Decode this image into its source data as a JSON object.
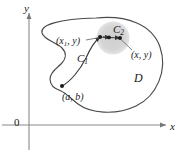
{
  "figure": {
    "colors": {
      "axis": "#8a8a8a",
      "curve": "#3a3a3a",
      "blob": "#4a4a4a",
      "disk_fill": "#d6d6d6",
      "point": "#1a1a1a",
      "label": "#1a1a1a",
      "background": "#ffffff"
    },
    "axes": {
      "y_label": "y",
      "x_label": "x",
      "origin_label": "0",
      "x_axis_y": 125,
      "y_axis_x": 29,
      "x_axis_start": 2,
      "x_axis_end": 168,
      "y_axis_top": 12,
      "y_axis_bottom": 150
    },
    "labels": {
      "region": "D",
      "curve1": "C",
      "curve1_sub": "1",
      "curve2": "C",
      "curve2_sub": "2",
      "point_start": "(a, b)",
      "point_mid": "(x",
      "point_mid_sub": "1",
      "point_mid_rest": ", y)",
      "point_end": "(x, y)"
    },
    "geometry": {
      "disk_center": [
        113,
        38
      ],
      "disk_radius": 16,
      "points": [
        {
          "name": "a-b",
          "x": 62,
          "y": 86
        },
        {
          "name": "x1-y",
          "x": 100,
          "y": 37
        },
        {
          "name": "mid-dot",
          "x": 109,
          "y": 37
        },
        {
          "name": "x-y",
          "x": 120,
          "y": 38
        }
      ]
    }
  }
}
